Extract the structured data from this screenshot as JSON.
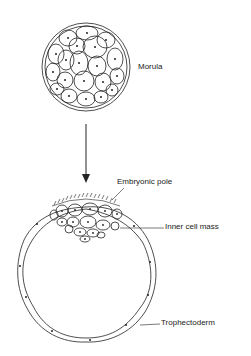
{
  "diagram": {
    "labels": {
      "morula": "Morula",
      "embryonic_pole": "Embryonic pole",
      "inner_cell_mass": "Inner cell mass",
      "trophectoderm": "Trophectoderm"
    },
    "colors": {
      "line": "#222222",
      "background": "#ffffff"
    }
  }
}
